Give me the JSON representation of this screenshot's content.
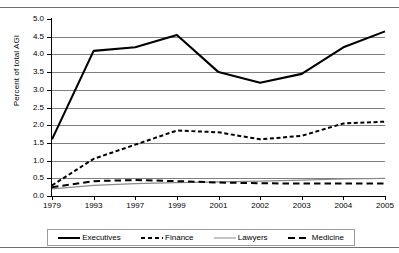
{
  "chart_data": {
    "type": "line",
    "title": "",
    "xlabel": "",
    "ylabel": "Percent of total AGI",
    "categories": [
      "1979",
      "1993",
      "1997",
      "1999",
      "2001",
      "2002",
      "2003",
      "2004",
      "2005"
    ],
    "ylim": [
      0.0,
      5.0
    ],
    "ytick_step": 0.5,
    "yticks": [
      "5.0",
      "4.5",
      "4.0",
      "3.5",
      "3.0",
      "2.5",
      "2.0",
      "1.5",
      "1.0",
      "0.5",
      "0.0"
    ],
    "grid": true,
    "legend_position": "bottom",
    "series": [
      {
        "name": "Executives",
        "style": "solid-thick",
        "color": "#000000",
        "values": [
          1.6,
          4.1,
          4.2,
          4.55,
          3.5,
          3.2,
          3.45,
          4.2,
          4.65
        ]
      },
      {
        "name": "Finance",
        "style": "dashed-short",
        "color": "#000000",
        "values": [
          0.3,
          1.05,
          1.45,
          1.85,
          1.8,
          1.6,
          1.7,
          2.05,
          2.1
        ]
      },
      {
        "name": "Lawyers",
        "style": "solid-thin",
        "color": "#8a8a8a",
        "values": [
          0.2,
          0.3,
          0.35,
          0.38,
          0.4,
          0.42,
          0.45,
          0.48,
          0.5
        ]
      },
      {
        "name": "Medicine",
        "style": "dashed-long",
        "color": "#000000",
        "values": [
          0.25,
          0.42,
          0.45,
          0.42,
          0.38,
          0.36,
          0.35,
          0.35,
          0.35
        ]
      }
    ]
  },
  "axis": {
    "y_label": "Percent of total AGI"
  },
  "legend": {
    "items": [
      {
        "label": "Executives"
      },
      {
        "label": "Finance"
      },
      {
        "label": "Lawyers"
      },
      {
        "label": "Medicine"
      }
    ]
  }
}
